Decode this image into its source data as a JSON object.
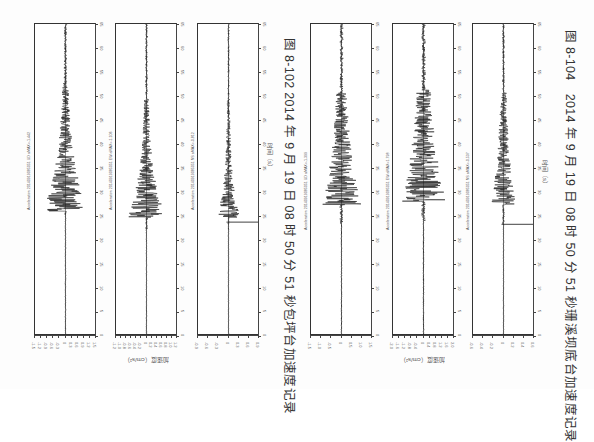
{
  "page": {
    "orientation": "rotated-90",
    "figures": [
      {
        "id": "fig-8-102",
        "caption": "图 8-102 2014 年 9 月 19 日 08 时 50 分 51 秒包坪台加速度记录",
        "x_axis_label": "时间（s）",
        "y_axis_label": "加速度（cm/s²）",
        "time_ticks": [
          "0",
          "5",
          "10",
          "15",
          "20",
          "25",
          "30",
          "35",
          "40",
          "45",
          "50",
          "55",
          "60",
          "65"
        ],
        "channels": [
          {
            "title": "Acceleration 20140919085051 UD aMAX=-1.442",
            "component": "UD",
            "amax": "-1.442",
            "amp_ticks": [
              "-1.5",
              "-1.2",
              "-0.9",
              "-0.6",
              "-0.3",
              "0",
              "0.3",
              "0.6",
              "0.9",
              "1.2",
              "1.5"
            ]
          },
          {
            "title": "Acceleration 20140919085051 EW aMAX=-1.106",
            "component": "EW",
            "amax": "-1.106",
            "amp_ticks": [
              "-1.2",
              "-1.0",
              "-0.8",
              "-0.6",
              "-0.4",
              "-0.2",
              "0",
              "0.2",
              "0.4",
              "0.6",
              "0.8",
              "1.0",
              "1.2"
            ]
          },
          {
            "title": "Acceleration 20140919085051 NS aMAX=-0.812",
            "component": "NS",
            "amax": "-0.812",
            "amp_ticks": [
              "-0.9",
              "-0.6",
              "-0.3",
              "0",
              "0.3",
              "0.6",
              "0.9"
            ]
          }
        ]
      },
      {
        "id": "fig-8-104",
        "caption": "图 8-104　2014 年 9 月 19 日 08 时 50 分 51 秒珊溪坝底台加速度记录",
        "x_axis_label": "时间（s）",
        "y_axis_label": "加速度（cm/s²）",
        "time_ticks": [
          "0",
          "5",
          "10",
          "15",
          "20",
          "25",
          "30",
          "35",
          "40",
          "45",
          "50",
          "55",
          "60",
          "65"
        ],
        "channels": [
          {
            "title": "Acceleration 20140919085051 UD aMAX=-1.399",
            "component": "UD",
            "amax": "-1.399",
            "amp_ticks": [
              "-1.5",
              "-1.0",
              "-0.5",
              "0",
              "0.5",
              "1.0",
              "1.5"
            ]
          },
          {
            "title": "Acceleration 20140919085051 EW aMAX=1.798",
            "component": "EW",
            "amax": "1.798",
            "amp_ticks": [
              "-2.0",
              "-1.6",
              "-1.2",
              "-0.8",
              "-0.4",
              "0",
              "0.4",
              "0.8",
              "1.2",
              "1.6",
              "2.0"
            ]
          },
          {
            "title": "Acceleration 20140919085051 NS aMAX=-0.537",
            "component": "NS",
            "amax": "-0.537",
            "amp_ticks": [
              "-0.6",
              "-0.4",
              "-0.2",
              "0",
              "0.2",
              "0.4",
              "0.6"
            ]
          }
        ]
      }
    ]
  },
  "layout_hints": {
    "figure_offsets": [
      34,
      310
    ],
    "panel_offsets": [
      0,
      81,
      163
    ],
    "caption_x": [
      287,
      563
    ],
    "colors": {
      "trace": "#1a1a1a",
      "frame": "#333333",
      "text": "#333333"
    }
  },
  "waveform_shape": {
    "fig-8-102": [
      {
        "onset": 0.58,
        "peak": 0.61,
        "peak_amp": 0.82,
        "coda_decay": 0.16,
        "noise": 0.05,
        "spike": null
      },
      {
        "onset": 0.6,
        "peak": 0.66,
        "peak_amp": 0.88,
        "coda_decay": 0.14,
        "noise": 0.04,
        "spike": null
      },
      {
        "onset": 0.6,
        "peak": 0.66,
        "peak_amp": 0.55,
        "coda_decay": 0.12,
        "noise": 0.03,
        "spike": 0.635
      }
    ],
    "fig-8-104": [
      {
        "onset": 0.56,
        "peak": 0.64,
        "peak_amp": 0.85,
        "coda_decay": 0.22,
        "noise": 0.06,
        "spike": null
      },
      {
        "onset": 0.55,
        "peak": 0.63,
        "peak_amp": 0.92,
        "coda_decay": 0.26,
        "noise": 0.07,
        "spike": null
      },
      {
        "onset": 0.56,
        "peak": 0.64,
        "peak_amp": 0.55,
        "coda_decay": 0.2,
        "noise": 0.04,
        "spike": 0.642
      }
    ]
  }
}
